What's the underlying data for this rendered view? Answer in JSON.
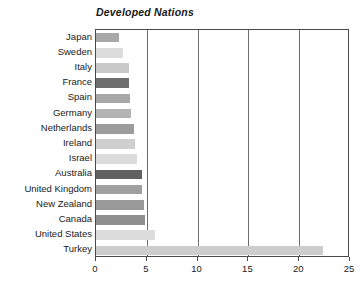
{
  "chart_data": {
    "type": "bar",
    "orientation": "horizontal",
    "title": "Developed Nations",
    "xlabel": "",
    "ylabel": "",
    "xlim": [
      0,
      25
    ],
    "xticks": [
      0,
      5,
      10,
      15,
      20,
      25
    ],
    "xtick_labels": [
      "0",
      "5",
      "10",
      "15",
      "20",
      "25"
    ],
    "grid": true,
    "grid_axis": "x",
    "legend": false,
    "categories": [
      "Japan",
      "Sweden",
      "Italy",
      "France",
      "Spain",
      "Germany",
      "Netherlands",
      "Ireland",
      "Israel",
      "Australia",
      "United Kingdom",
      "New Zealand",
      "Canada",
      "United States",
      "Turkey"
    ],
    "values": [
      2.3,
      2.7,
      3.2,
      3.2,
      3.3,
      3.4,
      3.7,
      3.8,
      4.0,
      4.5,
      4.5,
      4.7,
      4.8,
      5.8,
      22.3
    ],
    "bar_colors": [
      "#a8a8a8",
      "#dcdcdc",
      "#c9c9c9",
      "#6e6e6e",
      "#a8a8a8",
      "#b4b4b4",
      "#9c9c9c",
      "#cfcfcf",
      "#dcdcdc",
      "#616161",
      "#a0a0a0",
      "#9a9a9a",
      "#8f8f8f",
      "#dcdcdc",
      "#cdcdcd"
    ]
  },
  "axis": {
    "frame_color": "#4a4a4a",
    "gridline_color": "#6e6e6e"
  }
}
